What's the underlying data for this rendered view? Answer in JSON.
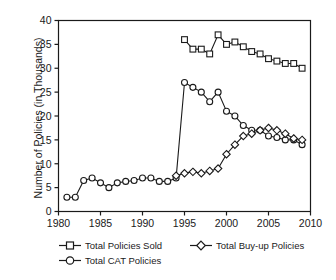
{
  "chart_data": {
    "type": "line",
    "title": "",
    "xlabel": "",
    "ylabel": "Number of Policies (in Thousands)",
    "xlim": [
      1980,
      2010
    ],
    "ylim": [
      0,
      40
    ],
    "xticks": [
      1980,
      1985,
      1990,
      1995,
      2000,
      2005,
      2010
    ],
    "yticks": [
      0,
      5,
      10,
      15,
      20,
      25,
      30,
      35,
      40
    ],
    "grid": false,
    "legend_position": "below-axes",
    "series": [
      {
        "name": "Total Policies Sold",
        "marker": "square",
        "x": [
          1995,
          1996,
          1997,
          1998,
          1999,
          2000,
          2001,
          2002,
          2003,
          2004,
          2005,
          2006,
          2007,
          2008,
          2009
        ],
        "values": [
          36,
          34,
          34,
          33,
          37,
          35,
          35.5,
          34.5,
          33.5,
          33,
          32,
          31.5,
          31,
          31,
          30
        ]
      },
      {
        "name": "Total CAT Policies",
        "marker": "circle",
        "x": [
          1981,
          1982,
          1983,
          1984,
          1985,
          1986,
          1987,
          1988,
          1989,
          1990,
          1991,
          1992,
          1993,
          1994,
          1995,
          1996,
          1997,
          1998,
          1999,
          2000,
          2001,
          2002,
          2003,
          2004,
          2005,
          2006,
          2007,
          2008,
          2009
        ],
        "values": [
          3,
          3,
          6.5,
          7,
          6,
          5,
          6,
          6.3,
          6.5,
          7,
          7,
          6.3,
          6.3,
          7,
          27,
          26,
          25,
          23,
          25,
          21,
          20,
          18,
          17,
          17,
          15.8,
          15.5,
          15,
          15,
          14
        ]
      },
      {
        "name": "Total Buy-up Policies",
        "marker": "diamond",
        "x": [
          1994,
          1995,
          1996,
          1997,
          1998,
          1999,
          2000,
          2001,
          2002,
          2003,
          2004,
          2005,
          2006,
          2007,
          2008,
          2009
        ],
        "values": [
          7.5,
          8,
          8.3,
          8,
          8.5,
          9,
          12,
          14,
          15.8,
          16.3,
          17,
          17.5,
          17,
          16.3,
          15.3,
          15
        ]
      }
    ]
  },
  "legend": {
    "entries": [
      {
        "label": "Total Policies Sold",
        "marker": "square-marker-icon"
      },
      {
        "label": "Total Buy-up Policies",
        "marker": "diamond-marker-icon"
      },
      {
        "label": "Total CAT Policies",
        "marker": "circle-marker-icon"
      }
    ]
  },
  "colors": {
    "line": "#1a1a1a",
    "marker_fill": "#ffffff",
    "axis": "#1a1a1a",
    "background": "#ffffff"
  }
}
